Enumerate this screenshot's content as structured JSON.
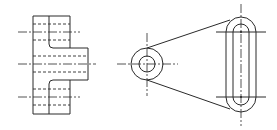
{
  "drawing": {
    "title": "",
    "colors": {
      "line": "#2a2a2a",
      "background": "#ffffff"
    },
    "views": [
      {
        "name": "side-view",
        "description": "Side elevation with flange and boss, hidden bores shown dashed"
      },
      {
        "name": "front-view",
        "description": "Link plate with circular boss at left and slotted end at right"
      }
    ],
    "side_view": {
      "flange": {
        "x": 33,
        "y": 16,
        "w": 37,
        "h": 98
      },
      "boss": {
        "x": 70,
        "y": 48,
        "w": 18,
        "h": 32
      },
      "center_y": 64
    },
    "front_view": {
      "boss": {
        "cx": 147,
        "cy": 64,
        "r_outer": 16,
        "r_inner": 8
      },
      "slot": {
        "cx": 241,
        "top_cy": 32,
        "bottom_cy": 97,
        "r_outer": 15,
        "r_inner": 8
      }
    }
  }
}
